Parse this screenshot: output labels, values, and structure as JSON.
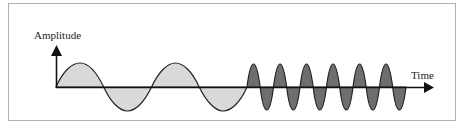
{
  "diagram": {
    "y_axis_label": "Amplitude",
    "x_axis_label": "Time",
    "colors": {
      "line": "#222222",
      "low_freq_fill": "#d9d9d9",
      "high_freq_fill": "#6e6e6e",
      "frame": "#b0b0b0"
    },
    "segments": [
      {
        "name": "low-frequency-wave",
        "cycles": 2,
        "fill": "light gray"
      },
      {
        "name": "high-frequency-wave",
        "cycles": 6,
        "fill": "dark gray"
      }
    ]
  }
}
